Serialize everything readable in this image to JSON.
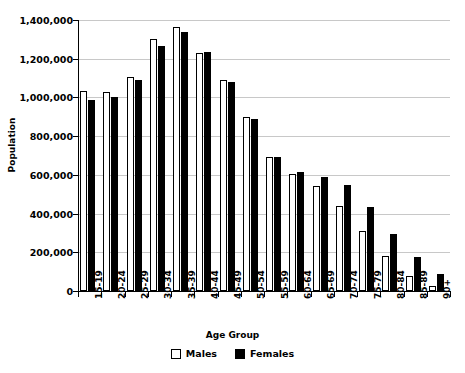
{
  "chart_data": {
    "type": "bar",
    "title": "",
    "xlabel": "Age Group",
    "ylabel": "Population",
    "ylim": [
      0,
      1400000
    ],
    "ytick_values": [
      0,
      200000,
      400000,
      600000,
      800000,
      1000000,
      1200000,
      1400000
    ],
    "ytick_labels": [
      "0",
      "200,000",
      "400,000",
      "600,000",
      "800,000",
      "1,000,000",
      "1,200,000",
      "1,400,000"
    ],
    "grid": "horizontal",
    "legend_position": "bottom-center",
    "categories": [
      "15-19",
      "20-24",
      "25-29",
      "30-34",
      "35-39",
      "40-44",
      "45-49",
      "50-54",
      "55-59",
      "60-64",
      "65-69",
      "70-74",
      "75-79",
      "80-84",
      "85-89",
      "90+"
    ],
    "series": [
      {
        "name": "Males",
        "color": "#ffffff",
        "edge_color": "#000000",
        "values": [
          1035000,
          1030000,
          1105000,
          1300000,
          1365000,
          1230000,
          1090000,
          900000,
          690000,
          605000,
          545000,
          440000,
          310000,
          180000,
          75000,
          25000
        ]
      },
      {
        "name": "Females",
        "color": "#000000",
        "edge_color": "#000000",
        "values": [
          985000,
          1000000,
          1090000,
          1265000,
          1340000,
          1235000,
          1080000,
          890000,
          690000,
          615000,
          590000,
          550000,
          435000,
          295000,
          175000,
          90000
        ]
      }
    ]
  },
  "legend": {
    "items": [
      {
        "label": "Males",
        "swatch": "open-square-swatch"
      },
      {
        "label": "Females",
        "swatch": "filled-square-swatch"
      }
    ]
  }
}
